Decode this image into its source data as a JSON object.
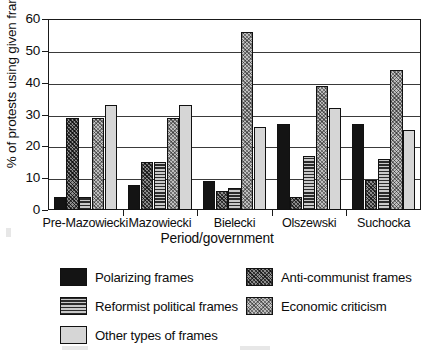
{
  "chart_data": {
    "type": "bar",
    "title": "",
    "xlabel": "Period/government",
    "ylabel": "% of protests using given frames",
    "ylim": [
      0,
      60
    ],
    "yticks": [
      0,
      10,
      20,
      30,
      40,
      50,
      60
    ],
    "grid": true,
    "legend_position": "bottom",
    "categories": [
      "Pre-Mazowiecki",
      "Mazowiecki",
      "Bielecki",
      "Olszewski",
      "Suchocka"
    ],
    "series": [
      {
        "name": "Polarizing frames",
        "pattern": "solid-black",
        "color": "#141414",
        "values": [
          4,
          8,
          9,
          27,
          27
        ]
      },
      {
        "name": "Anti-communist frames",
        "pattern": "dark-crosshatch",
        "color": "#8d8d8d",
        "values": [
          29,
          15,
          6,
          4,
          9.5
        ]
      },
      {
        "name": "Reformist political frames",
        "pattern": "horizontal-lines",
        "color": "#9a9a9a",
        "values": [
          4,
          15,
          7,
          17,
          16
        ]
      },
      {
        "name": "Economic criticism",
        "pattern": "light-crosshatch",
        "color": "#c0c0c0",
        "values": [
          29,
          29,
          56,
          39,
          44
        ]
      },
      {
        "name": "Other types of frames",
        "pattern": "solid-lightgray",
        "color": "#d6d6d6",
        "values": [
          33,
          33,
          26,
          32,
          25
        ]
      }
    ]
  }
}
